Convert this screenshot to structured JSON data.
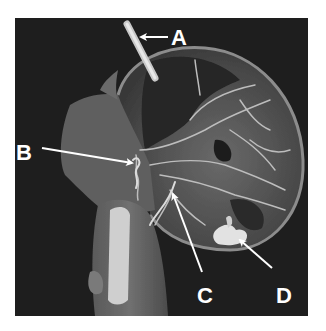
{
  "figure": {
    "background": "#ffffff",
    "panel_color": "#1e1e1e",
    "structure_color": "#8a8a8a",
    "highlight_color": "#e6e6e6",
    "arrow_color": "#ffffff",
    "labels": [
      {
        "id": "A",
        "text": "A"
      },
      {
        "id": "B",
        "text": "B"
      },
      {
        "id": "C",
        "text": "C"
      },
      {
        "id": "D",
        "text": "D"
      }
    ]
  }
}
